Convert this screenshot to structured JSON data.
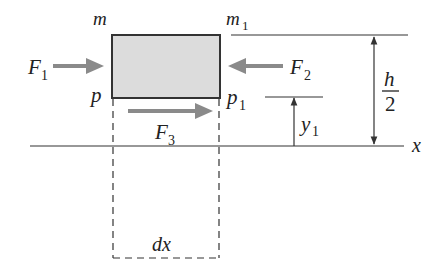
{
  "figure": {
    "colors": {
      "element_fill": "#dcdcdc",
      "element_border": "#333333",
      "force_arrow": "#8a8a8a",
      "line": "#333333"
    },
    "labels": {
      "m": "m",
      "m1_base": "m",
      "m1_sub": "1",
      "p": "p",
      "p1_base": "p",
      "p1_sub": "1",
      "F1_base": "F",
      "F1_sub": "1",
      "F2_base": "F",
      "F2_sub": "2",
      "F3_base": "F",
      "F3_sub": "3",
      "y1_base": "y",
      "y1_sub": "1",
      "h": "h",
      "two": "2",
      "x_axis": "x",
      "dx": "dx"
    },
    "forces": [
      {
        "name": "F1",
        "direction": "right",
        "acts_on": "left face"
      },
      {
        "name": "F2",
        "direction": "left",
        "acts_on": "right face"
      },
      {
        "name": "F3",
        "direction": "right",
        "acts_on": "bottom face (shear)"
      }
    ],
    "dimensions": [
      {
        "name": "h/2",
        "from": "neutral axis x",
        "to": "top surface"
      },
      {
        "name": "y1",
        "from": "neutral axis x",
        "to": "level p-p1"
      },
      {
        "name": "dx",
        "description": "element length"
      }
    ]
  }
}
